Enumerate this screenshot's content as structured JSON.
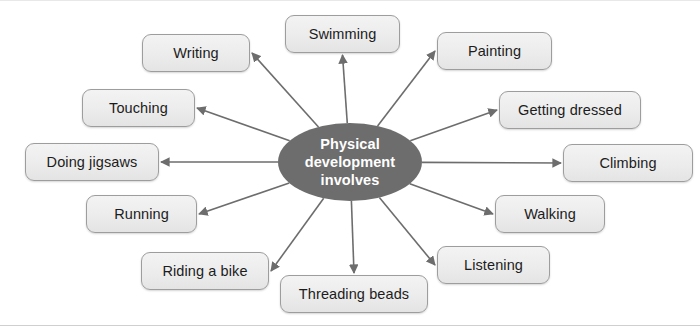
{
  "diagram": {
    "type": "spider-map",
    "title": "Physical development involves",
    "hub": {
      "label": "Physical development involves",
      "lines": [
        "Physical",
        "development",
        "involves"
      ],
      "fill": "#6d6d6d",
      "text_color": "#ffffff",
      "cx": 350,
      "cy": 161,
      "rx": 72,
      "ry": 39
    },
    "style": {
      "background": "#ffffff",
      "node_fill": "#ececec",
      "node_border": "#9d9d9d",
      "node_text": "#1c1c1c",
      "edge_color": "#6d6d6d"
    },
    "nodes": [
      {
        "id": "swimming",
        "label": "Swimming",
        "x": 285,
        "y": 14,
        "w": 115,
        "h": 38,
        "anchor": "bottom"
      },
      {
        "id": "writing",
        "label": "Writing",
        "x": 142,
        "y": 33,
        "w": 108,
        "h": 38,
        "anchor": "right"
      },
      {
        "id": "touching",
        "label": "Touching",
        "x": 82,
        "y": 88,
        "w": 113,
        "h": 38,
        "anchor": "right"
      },
      {
        "id": "doing-jigsaws",
        "label": "Doing jigsaws",
        "x": 25,
        "y": 142,
        "w": 134,
        "h": 38,
        "anchor": "right"
      },
      {
        "id": "running",
        "label": "Running",
        "x": 86,
        "y": 194,
        "w": 111,
        "h": 38,
        "anchor": "right"
      },
      {
        "id": "riding-a-bike",
        "label": "Riding a bike",
        "x": 141,
        "y": 251,
        "w": 128,
        "h": 38,
        "anchor": "right"
      },
      {
        "id": "threading-beads",
        "label": "Threading beads",
        "x": 280,
        "y": 274,
        "w": 148,
        "h": 38,
        "anchor": "top"
      },
      {
        "id": "listening",
        "label": "Listening",
        "x": 437,
        "y": 245,
        "w": 113,
        "h": 38,
        "anchor": "left"
      },
      {
        "id": "walking",
        "label": "Walking",
        "x": 495,
        "y": 194,
        "w": 110,
        "h": 38,
        "anchor": "left"
      },
      {
        "id": "climbing",
        "label": "Climbing",
        "x": 563,
        "y": 143,
        "w": 130,
        "h": 38,
        "anchor": "left"
      },
      {
        "id": "getting-dressed",
        "label": "Getting dressed",
        "x": 499,
        "y": 90,
        "w": 142,
        "h": 38,
        "anchor": "left"
      },
      {
        "id": "painting",
        "label": "Painting",
        "x": 437,
        "y": 31,
        "w": 115,
        "h": 38,
        "anchor": "left"
      }
    ]
  }
}
